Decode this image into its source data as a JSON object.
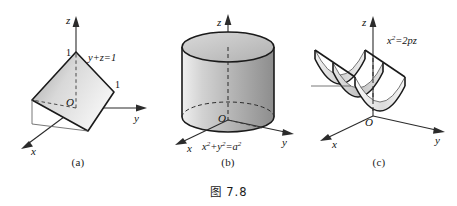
{
  "figure": {
    "caption": "图 7.8",
    "background_color": "#ffffff",
    "ink_color": "#1a1a1a"
  },
  "panels": [
    {
      "id": "a",
      "subcaption": "(a)",
      "equation": "y+z=1",
      "surface_type": "plane",
      "axes": {
        "x_label": "x",
        "y_label": "y",
        "z_label": "z",
        "origin_label": "O"
      },
      "tick_labels": {
        "z_intercept": "1",
        "y_intercept": "1"
      },
      "shading": {
        "fill_light": "#f2f2f2",
        "fill_dark": "#9d9d9d"
      }
    },
    {
      "id": "b",
      "subcaption": "(b)",
      "equation_parts": {
        "x_base": "x",
        "x_sup": "2",
        "plus": "+",
        "y_base": "y",
        "y_sup": "2",
        "equals": "=",
        "a_base": "a",
        "a_sup": "2"
      },
      "equation": "x²+y²=a²",
      "surface_type": "circular-cylinder",
      "axes": {
        "x_label": "x",
        "y_label": "y",
        "z_label": "z",
        "origin_label": "O"
      },
      "shading": {
        "fill_light": "#f4f4f4",
        "fill_mid": "#c9c9c9",
        "fill_dark": "#8f8f8f",
        "cap_fill": "#c4c4c4"
      }
    },
    {
      "id": "c",
      "subcaption": "(c)",
      "equation_parts": {
        "x_base": "x",
        "x_sup": "2",
        "equals": "=2",
        "tail": "pz"
      },
      "equation": "x²=2pz",
      "surface_type": "parabolic-cylinder",
      "axes": {
        "x_label": "x",
        "y_label": "y",
        "z_label": "z",
        "origin_label": "O"
      },
      "shading": {
        "fill_light": "#fafafa",
        "fill_mid": "#cfcfcf",
        "fill_dark": "#a8a8a8"
      }
    }
  ]
}
